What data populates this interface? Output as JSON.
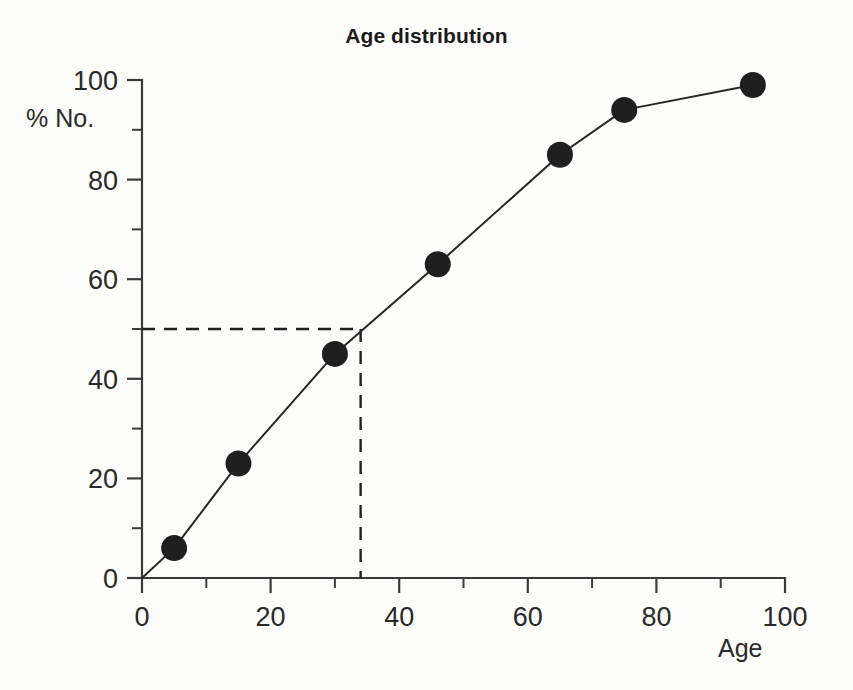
{
  "chart_data": {
    "type": "line",
    "title": "Age distribution",
    "xlabel": "Age",
    "ylabel": "% No.",
    "xlim": [
      0,
      100
    ],
    "ylim": [
      0,
      100
    ],
    "grid": false,
    "legend": null,
    "x_ticks_major": [
      0,
      20,
      40,
      60,
      80,
      100
    ],
    "x_ticks_minor": [
      10,
      30,
      50,
      70,
      90
    ],
    "y_ticks_major": [
      0,
      20,
      40,
      60,
      80,
      100
    ],
    "y_ticks_minor": [
      10,
      30,
      50,
      70,
      90
    ],
    "x_tick_labels": [
      "0",
      "20",
      "40",
      "60",
      "80",
      "100"
    ],
    "y_tick_labels": [
      "0",
      "20",
      "40",
      "60",
      "80",
      "100"
    ],
    "series": [
      {
        "name": "Cumulative % No. by age",
        "marker": "filled-circle",
        "x": [
          0,
          5,
          15,
          30,
          46,
          65,
          75,
          95
        ],
        "y": [
          0,
          6,
          23,
          45,
          63,
          85,
          94,
          99
        ]
      }
    ],
    "annotations": [
      {
        "name": "median-reference",
        "style": "dashed",
        "y_value": 50,
        "x_value": 34,
        "description": "Dashed lines marking the 50% level and the corresponding median age"
      }
    ]
  }
}
